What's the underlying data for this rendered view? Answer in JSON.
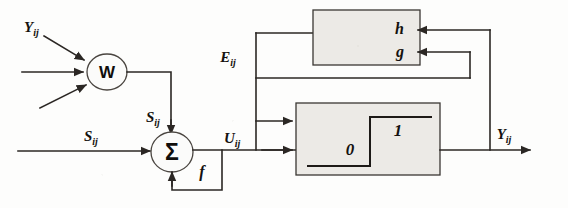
{
  "diagram": {
    "nodes": {
      "weight_node": {
        "glyph": "W",
        "name": "weight-node"
      },
      "sum_node": {
        "glyph": "Σ",
        "name": "summation-node"
      },
      "adaptation_box": {
        "name": "adaptation-box",
        "labels": [
          "h",
          "g"
        ]
      },
      "threshold_box": {
        "name": "threshold-box",
        "low_label": "0",
        "high_label": "1"
      },
      "feedback_function": {
        "glyph": "f",
        "name": "feedback-function"
      }
    },
    "signals": {
      "input_y": {
        "base": "Y",
        "sub": "ij"
      },
      "state_s_top": {
        "base": "S",
        "sub": "ij"
      },
      "state_s_left": {
        "base": "S",
        "sub": "ij"
      },
      "potential_u": {
        "base": "U",
        "sub": "ij"
      },
      "error_e": {
        "base": "E",
        "sub": "ij"
      },
      "output_y": {
        "base": "Y",
        "sub": "ij"
      }
    },
    "colors": {
      "line": "#2b2724",
      "box_fill": "#eceae6",
      "box_border": "#3b3733",
      "text": "#15120f",
      "background": "#fdfdfc"
    }
  }
}
